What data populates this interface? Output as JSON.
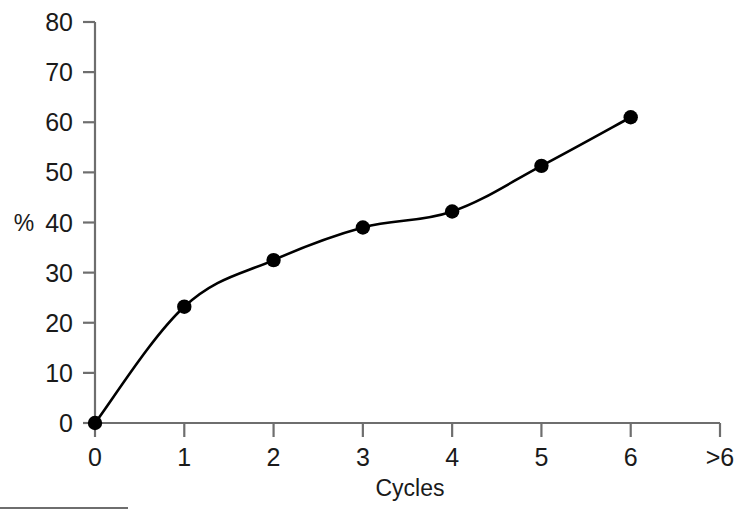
{
  "chart_data": {
    "type": "line",
    "title": "",
    "xlabel": "Cycles",
    "ylabel": "%",
    "x": [
      0,
      1,
      2,
      3,
      4,
      5,
      6
    ],
    "values": [
      0,
      23.2,
      32.5,
      39,
      42.2,
      51.3,
      61
    ],
    "series": [
      {
        "name": "",
        "values": [
          0,
          23.2,
          32.5,
          39,
          42.2,
          51.3,
          61
        ]
      }
    ],
    "xtick_labels": [
      "0",
      "1",
      "2",
      "3",
      "4",
      "5",
      "6",
      ">6"
    ],
    "ytick_labels": [
      "0",
      "10",
      "20",
      "30",
      "40",
      "50",
      "60",
      "70",
      "80"
    ],
    "ytick_values": [
      0,
      10,
      20,
      30,
      40,
      50,
      60,
      70,
      80
    ],
    "ylim": [
      0,
      80
    ],
    "xlim": [
      0,
      7
    ],
    "grid": false,
    "legend": false,
    "marker": "filled-circle",
    "marker_color": "#000000",
    "line_color": "#000000",
    "axis_color": "#6e6e6e",
    "background": "#ffffff",
    "annotations": []
  },
  "axes": {
    "y_title": "%",
    "x_title": "Cycles"
  },
  "ticks": {
    "y": [
      {
        "label": "80",
        "value": 80
      },
      {
        "label": "70",
        "value": 70
      },
      {
        "label": "60",
        "value": 60
      },
      {
        "label": "50",
        "value": 50
      },
      {
        "label": "40",
        "value": 40
      },
      {
        "label": "30",
        "value": 30
      },
      {
        "label": "20",
        "value": 20
      },
      {
        "label": "10",
        "value": 10
      },
      {
        "label": "0",
        "value": 0
      }
    ],
    "x": [
      {
        "label": "0",
        "value": 0
      },
      {
        "label": "1",
        "value": 1
      },
      {
        "label": "2",
        "value": 2
      },
      {
        "label": "3",
        "value": 3
      },
      {
        "label": "4",
        "value": 4
      },
      {
        "label": "5",
        "value": 5
      },
      {
        "label": "6",
        "value": 6
      },
      {
        "label": ">6",
        "value": 7
      }
    ]
  }
}
